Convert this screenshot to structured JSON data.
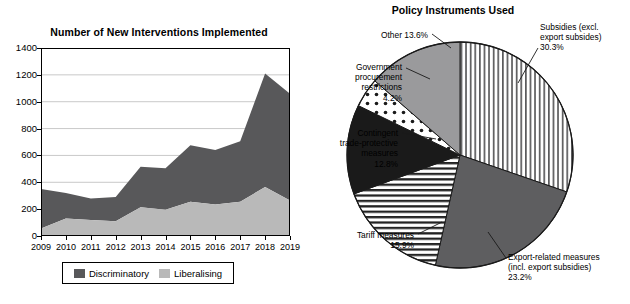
{
  "area_chart": {
    "title": "Number of New Interventions Implemented",
    "legend": [
      {
        "label": "Discriminatory",
        "color": "#58585a"
      },
      {
        "label": "Liberalising",
        "color": "#b9b9b9"
      }
    ]
  },
  "pie_chart": {
    "title": "Policy Instruments Used"
  },
  "chart_data": [
    {
      "type": "area",
      "title": "Number of New Interventions Implemented",
      "xlabel": "",
      "ylabel": "",
      "ylim": [
        0,
        1400
      ],
      "ytick_step": 200,
      "yticks": [
        0,
        200,
        400,
        600,
        800,
        1000,
        1200,
        1400
      ],
      "grid": true,
      "stacked": true,
      "legend_position": "bottom",
      "categories": [
        "2009",
        "2010",
        "2011",
        "2012",
        "2013",
        "2014",
        "2015",
        "2016",
        "2017",
        "2018",
        "2019"
      ],
      "series": [
        {
          "name": "Liberalising",
          "color": "#b9b9b9",
          "values": [
            55,
            130,
            120,
            110,
            215,
            195,
            255,
            235,
            255,
            365,
            265
          ]
        },
        {
          "name": "Discriminatory",
          "color": "#58585a",
          "values": [
            295,
            190,
            160,
            180,
            300,
            310,
            420,
            405,
            450,
            845,
            795
          ]
        }
      ],
      "totals": [
        350,
        320,
        280,
        290,
        515,
        505,
        675,
        640,
        705,
        1210,
        1060
      ]
    },
    {
      "type": "pie",
      "title": "Policy Instruments Used",
      "start_angle_deg": 0,
      "direction": "clockwise",
      "labels": [
        "Subsidies (excl. export subsides)",
        "Export-related measures (incl. export subsidies)",
        "Tariff measures",
        "Contingent trade-protective measures",
        "Government procurement restrictions",
        "Other"
      ],
      "values": [
        30.3,
        23.2,
        15.9,
        12.8,
        4.2,
        13.6
      ],
      "slices": [
        {
          "name": "subsidies",
          "label_lines": [
            "Subsidies (excl.",
            "export subsides)",
            "30.3%"
          ],
          "value": 30.3,
          "value_text": "30.3%",
          "pattern": "vertical-lines",
          "fill": "#ffffff"
        },
        {
          "name": "export-related-measures",
          "label_lines": [
            "Export-related measures",
            "(incl. export subsidies)",
            "23.2%"
          ],
          "value": 23.2,
          "value_text": "23.2%",
          "pattern": "solid-dark-gray",
          "fill": "#5e5e60"
        },
        {
          "name": "tariff-measures",
          "label_lines": [
            "Tariff measures",
            "15.9%"
          ],
          "value": 15.9,
          "value_text": "15.9%",
          "pattern": "horizontal-lines",
          "fill": "#ffffff"
        },
        {
          "name": "contingent-trade-protective-measures",
          "label_lines": [
            "Contingent",
            "trade-protective",
            "measures",
            "12.8%"
          ],
          "value": 12.8,
          "value_text": "12.8%",
          "pattern": "solid-black",
          "fill": "#1a1a1a"
        },
        {
          "name": "government-procurement-restrictions",
          "label_lines": [
            "Government",
            "procurement",
            "restrictions",
            "4.2%"
          ],
          "value": 4.2,
          "value_text": "4.2%",
          "pattern": "dots",
          "fill": "#ffffff"
        },
        {
          "name": "other",
          "label_lines": [
            "Other 13.6%"
          ],
          "value": 13.6,
          "value_text": "13.6%",
          "pattern": "solid-medium-gray",
          "fill": "#9a9a9c"
        }
      ]
    }
  ]
}
